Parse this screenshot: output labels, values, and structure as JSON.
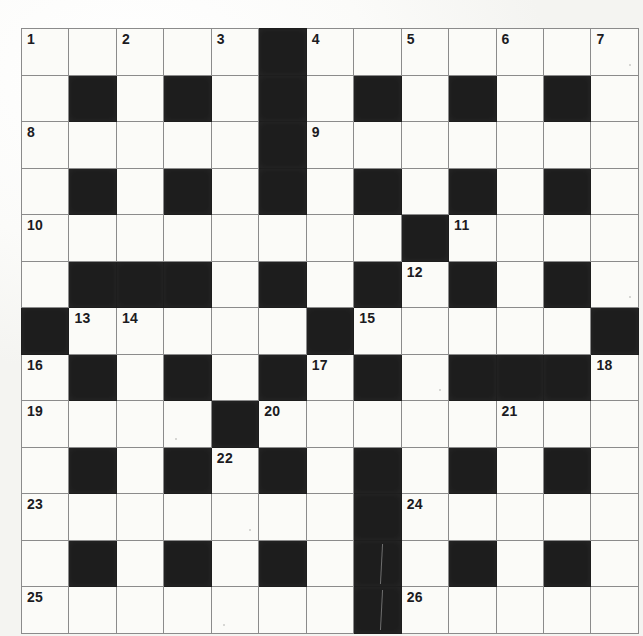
{
  "puzzle": {
    "title": "Crossword Grid",
    "rows": 13,
    "columns": 13,
    "colors": {
      "paper": "#fbfbf8",
      "block": "#1d1d1d",
      "gridline": "#8b8b8b",
      "border": "#4a4a4a",
      "number": "#1b1b22"
    },
    "clue_numbers": [
      1,
      2,
      3,
      4,
      5,
      6,
      7,
      8,
      9,
      10,
      11,
      12,
      13,
      14,
      15,
      16,
      17,
      18,
      19,
      20,
      21,
      22,
      23,
      24,
      25,
      26
    ],
    "legend": {
      "white_cell": "fillable letter square",
      "black_cell": "blocked square"
    },
    "grid": [
      [
        {
          "type": "white",
          "number": "1"
        },
        {
          "type": "white",
          "number": ""
        },
        {
          "type": "white",
          "number": "2"
        },
        {
          "type": "white",
          "number": ""
        },
        {
          "type": "white",
          "number": "3"
        },
        {
          "type": "black",
          "number": ""
        },
        {
          "type": "white",
          "number": "4"
        },
        {
          "type": "white",
          "number": ""
        },
        {
          "type": "white",
          "number": "5"
        },
        {
          "type": "white",
          "number": ""
        },
        {
          "type": "white",
          "number": "6"
        },
        {
          "type": "white",
          "number": ""
        },
        {
          "type": "white",
          "number": "7"
        }
      ],
      [
        {
          "type": "white",
          "number": ""
        },
        {
          "type": "black",
          "number": ""
        },
        {
          "type": "white",
          "number": ""
        },
        {
          "type": "black",
          "number": ""
        },
        {
          "type": "white",
          "number": ""
        },
        {
          "type": "black",
          "number": ""
        },
        {
          "type": "white",
          "number": ""
        },
        {
          "type": "black",
          "number": ""
        },
        {
          "type": "white",
          "number": ""
        },
        {
          "type": "black",
          "number": ""
        },
        {
          "type": "white",
          "number": ""
        },
        {
          "type": "black",
          "number": ""
        },
        {
          "type": "white",
          "number": ""
        }
      ],
      [
        {
          "type": "white",
          "number": "8"
        },
        {
          "type": "white",
          "number": ""
        },
        {
          "type": "white",
          "number": ""
        },
        {
          "type": "white",
          "number": ""
        },
        {
          "type": "white",
          "number": ""
        },
        {
          "type": "black",
          "number": ""
        },
        {
          "type": "white",
          "number": "9"
        },
        {
          "type": "white",
          "number": ""
        },
        {
          "type": "white",
          "number": ""
        },
        {
          "type": "white",
          "number": ""
        },
        {
          "type": "white",
          "number": ""
        },
        {
          "type": "white",
          "number": ""
        },
        {
          "type": "white",
          "number": ""
        }
      ],
      [
        {
          "type": "white",
          "number": ""
        },
        {
          "type": "black",
          "number": ""
        },
        {
          "type": "white",
          "number": ""
        },
        {
          "type": "black",
          "number": ""
        },
        {
          "type": "white",
          "number": ""
        },
        {
          "type": "black",
          "number": ""
        },
        {
          "type": "white",
          "number": ""
        },
        {
          "type": "black",
          "number": ""
        },
        {
          "type": "white",
          "number": ""
        },
        {
          "type": "black",
          "number": ""
        },
        {
          "type": "white",
          "number": ""
        },
        {
          "type": "black",
          "number": ""
        },
        {
          "type": "white",
          "number": ""
        }
      ],
      [
        {
          "type": "white",
          "number": "10"
        },
        {
          "type": "white",
          "number": ""
        },
        {
          "type": "white",
          "number": ""
        },
        {
          "type": "white",
          "number": ""
        },
        {
          "type": "white",
          "number": ""
        },
        {
          "type": "white",
          "number": ""
        },
        {
          "type": "white",
          "number": ""
        },
        {
          "type": "white",
          "number": ""
        },
        {
          "type": "black",
          "number": ""
        },
        {
          "type": "white",
          "number": "11"
        },
        {
          "type": "white",
          "number": ""
        },
        {
          "type": "white",
          "number": ""
        },
        {
          "type": "white",
          "number": ""
        }
      ],
      [
        {
          "type": "white",
          "number": ""
        },
        {
          "type": "black",
          "number": ""
        },
        {
          "type": "black",
          "number": ""
        },
        {
          "type": "black",
          "number": ""
        },
        {
          "type": "white",
          "number": ""
        },
        {
          "type": "black",
          "number": ""
        },
        {
          "type": "white",
          "number": ""
        },
        {
          "type": "black",
          "number": ""
        },
        {
          "type": "white",
          "number": "12"
        },
        {
          "type": "black",
          "number": ""
        },
        {
          "type": "white",
          "number": ""
        },
        {
          "type": "black",
          "number": ""
        },
        {
          "type": "white",
          "number": ""
        }
      ],
      [
        {
          "type": "black",
          "number": ""
        },
        {
          "type": "white",
          "number": "13"
        },
        {
          "type": "white",
          "number": "14"
        },
        {
          "type": "white",
          "number": ""
        },
        {
          "type": "white",
          "number": ""
        },
        {
          "type": "white",
          "number": ""
        },
        {
          "type": "black",
          "number": ""
        },
        {
          "type": "white",
          "number": "15"
        },
        {
          "type": "white",
          "number": ""
        },
        {
          "type": "white",
          "number": ""
        },
        {
          "type": "white",
          "number": ""
        },
        {
          "type": "white",
          "number": ""
        },
        {
          "type": "black",
          "number": ""
        }
      ],
      [
        {
          "type": "white",
          "number": "16"
        },
        {
          "type": "black",
          "number": ""
        },
        {
          "type": "white",
          "number": ""
        },
        {
          "type": "black",
          "number": ""
        },
        {
          "type": "white",
          "number": ""
        },
        {
          "type": "black",
          "number": ""
        },
        {
          "type": "white",
          "number": "17"
        },
        {
          "type": "black",
          "number": ""
        },
        {
          "type": "white",
          "number": ""
        },
        {
          "type": "black",
          "number": ""
        },
        {
          "type": "black",
          "number": ""
        },
        {
          "type": "black",
          "number": ""
        },
        {
          "type": "white",
          "number": "18"
        }
      ],
      [
        {
          "type": "white",
          "number": "19"
        },
        {
          "type": "white",
          "number": ""
        },
        {
          "type": "white",
          "number": ""
        },
        {
          "type": "white",
          "number": ""
        },
        {
          "type": "black",
          "number": ""
        },
        {
          "type": "white",
          "number": "20"
        },
        {
          "type": "white",
          "number": ""
        },
        {
          "type": "white",
          "number": ""
        },
        {
          "type": "white",
          "number": ""
        },
        {
          "type": "white",
          "number": ""
        },
        {
          "type": "white",
          "number": "21"
        },
        {
          "type": "white",
          "number": ""
        },
        {
          "type": "white",
          "number": ""
        }
      ],
      [
        {
          "type": "white",
          "number": ""
        },
        {
          "type": "black",
          "number": ""
        },
        {
          "type": "white",
          "number": ""
        },
        {
          "type": "black",
          "number": ""
        },
        {
          "type": "white",
          "number": "22"
        },
        {
          "type": "black",
          "number": ""
        },
        {
          "type": "white",
          "number": ""
        },
        {
          "type": "black",
          "number": ""
        },
        {
          "type": "white",
          "number": ""
        },
        {
          "type": "black",
          "number": ""
        },
        {
          "type": "white",
          "number": ""
        },
        {
          "type": "black",
          "number": ""
        },
        {
          "type": "white",
          "number": ""
        }
      ],
      [
        {
          "type": "white",
          "number": "23"
        },
        {
          "type": "white",
          "number": ""
        },
        {
          "type": "white",
          "number": ""
        },
        {
          "type": "white",
          "number": ""
        },
        {
          "type": "white",
          "number": ""
        },
        {
          "type": "white",
          "number": ""
        },
        {
          "type": "white",
          "number": ""
        },
        {
          "type": "black",
          "number": ""
        },
        {
          "type": "white",
          "number": "24"
        },
        {
          "type": "white",
          "number": ""
        },
        {
          "type": "white",
          "number": ""
        },
        {
          "type": "white",
          "number": ""
        },
        {
          "type": "white",
          "number": ""
        }
      ],
      [
        {
          "type": "white",
          "number": ""
        },
        {
          "type": "black",
          "number": ""
        },
        {
          "type": "white",
          "number": ""
        },
        {
          "type": "black",
          "number": ""
        },
        {
          "type": "white",
          "number": ""
        },
        {
          "type": "black",
          "number": ""
        },
        {
          "type": "white",
          "number": ""
        },
        {
          "type": "black",
          "number": ""
        },
        {
          "type": "white",
          "number": ""
        },
        {
          "type": "black",
          "number": ""
        },
        {
          "type": "white",
          "number": ""
        },
        {
          "type": "black",
          "number": ""
        },
        {
          "type": "white",
          "number": ""
        }
      ],
      [
        {
          "type": "white",
          "number": "25"
        },
        {
          "type": "white",
          "number": ""
        },
        {
          "type": "white",
          "number": ""
        },
        {
          "type": "white",
          "number": ""
        },
        {
          "type": "white",
          "number": ""
        },
        {
          "type": "white",
          "number": ""
        },
        {
          "type": "white",
          "number": ""
        },
        {
          "type": "black",
          "number": ""
        },
        {
          "type": "white",
          "number": "26"
        },
        {
          "type": "white",
          "number": ""
        },
        {
          "type": "white",
          "number": ""
        },
        {
          "type": "white",
          "number": ""
        },
        {
          "type": "white",
          "number": ""
        }
      ]
    ]
  }
}
